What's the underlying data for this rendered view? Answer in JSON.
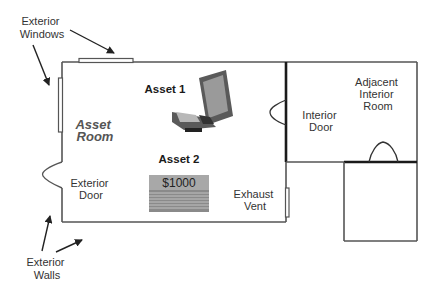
{
  "labels": {
    "exterior_windows": [
      "Exterior",
      "Windows"
    ],
    "exterior_walls": [
      "Exterior",
      "Walls"
    ],
    "asset_room": [
      "Asset",
      "Room"
    ],
    "asset1": "Asset 1",
    "asset2": "Asset 2",
    "money_amount": "$1000",
    "exterior_door": [
      "Exterior",
      "Door"
    ],
    "exhaust_vent": [
      "Exhaust",
      "Vent"
    ],
    "interior_door": [
      "Interior",
      "Door"
    ],
    "adjacent_room": [
      "Adjacent",
      "Interior",
      "Room"
    ]
  },
  "icons": {
    "asset1": "laptop-icon",
    "asset2": "money-stack-icon"
  },
  "colors": {
    "wall": "#555555",
    "interior_wall": "#1a1a1a",
    "money_top": "#a8a8a8",
    "money_stack": "#8a8a8a",
    "laptop_body": "#5a5a5a",
    "laptop_screen": "#9a9a9a"
  }
}
